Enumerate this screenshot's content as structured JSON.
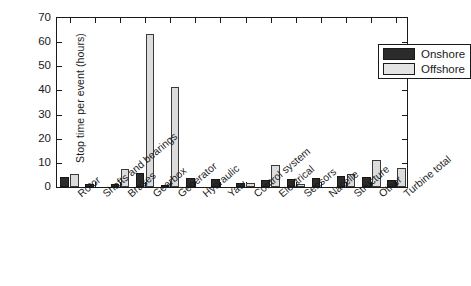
{
  "chart_data": {
    "type": "bar",
    "title": "",
    "xlabel": "",
    "ylabel": "Stop time per event (hours)",
    "ylim": [
      0,
      70
    ],
    "yticks": [
      0,
      10,
      20,
      30,
      40,
      50,
      60,
      70
    ],
    "grid": false,
    "legend_position": "top-right",
    "categories": [
      "Rotor",
      "Shafts and bearings",
      "Brakes",
      "Gearbox",
      "Generator",
      "Hydraulic",
      "Yaw",
      "Control system",
      "Electrical",
      "Sensors",
      "Nacelle",
      "Structure",
      "Other",
      "Turbine total"
    ],
    "series": [
      {
        "name": "Onshore",
        "color": "#2b2b2b",
        "values": [
          4.0,
          1.2,
          1.4,
          6.0,
          1.0,
          3.6,
          3.2,
          1.6,
          3.0,
          3.2,
          3.6,
          4.4,
          4.0,
          2.8
        ]
      },
      {
        "name": "Offshore",
        "color": "#dcdcdc",
        "values": [
          5.5,
          0.0,
          7.5,
          63.5,
          41.3,
          0.0,
          0.0,
          1.8,
          9.0,
          1.2,
          0.0,
          5.2,
          11.0,
          8.0
        ]
      }
    ]
  },
  "legend": {
    "items": [
      {
        "label": "Onshore",
        "swatch": "onshore"
      },
      {
        "label": "Offshore",
        "swatch": "offshore"
      }
    ]
  }
}
